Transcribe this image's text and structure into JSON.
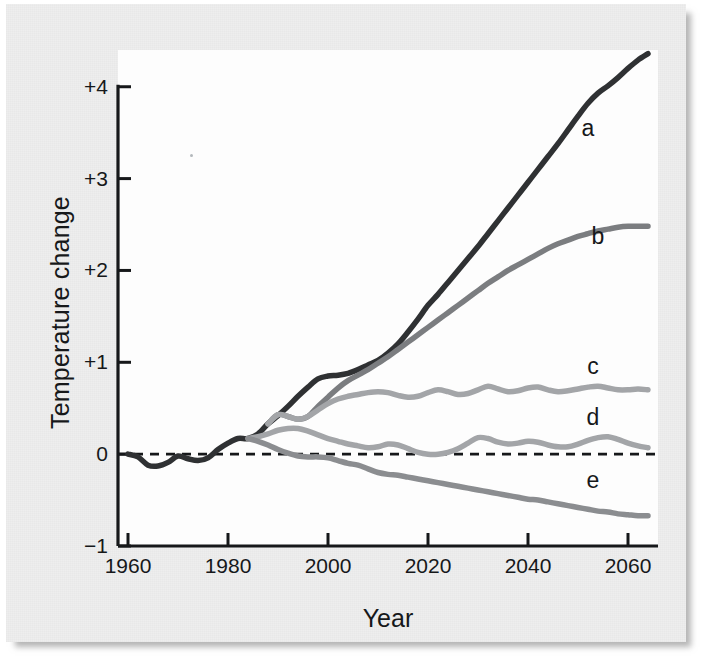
{
  "figure": {
    "background_color": "#eeeeee",
    "plot_background_color": "#fdfdfd",
    "axis_color": "#16181a",
    "zero_line_label": "0"
  },
  "chart_data": {
    "type": "line",
    "title": "",
    "xlabel": "Year",
    "ylabel": "Temperature change",
    "xlim": [
      1958,
      2066
    ],
    "ylim": [
      -1,
      4.4
    ],
    "xticks": [
      1960,
      1980,
      2000,
      2020,
      2040,
      2060
    ],
    "xtick_labels": [
      "1960",
      "1980",
      "2000",
      "2020",
      "2040",
      "2060"
    ],
    "yticks": [
      -1,
      0,
      1,
      2,
      3,
      4
    ],
    "ytick_labels": [
      "−1",
      "0",
      "+1",
      "+2",
      "+3",
      "+4"
    ],
    "grid": false,
    "legend_position": "inline-right-end-labels",
    "zero_reference_line": {
      "value": 0,
      "style": "dashed",
      "color": "#16181a"
    },
    "annotations": [
      {
        "text": "a",
        "x": 2052,
        "y": 3.55
      },
      {
        "text": "b",
        "x": 2054,
        "y": 2.38
      },
      {
        "text": "c",
        "x": 2053,
        "y": 0.96
      },
      {
        "text": "d",
        "x": 2053,
        "y": 0.4
      },
      {
        "text": "e",
        "x": 2053,
        "y": -0.28
      }
    ],
    "series": [
      {
        "name": "a",
        "label": "a",
        "color": "#2f3133",
        "linewidth": 5.5,
        "x": [
          1960,
          1962,
          1964,
          1966,
          1968,
          1970,
          1972,
          1974,
          1976,
          1978,
          1980,
          1982,
          1984,
          1986,
          1988,
          1990,
          1992,
          1994,
          1996,
          1998,
          2000,
          2002,
          2004,
          2006,
          2008,
          2010,
          2012,
          2014,
          2016,
          2018,
          2020,
          2022,
          2024,
          2026,
          2028,
          2030,
          2032,
          2034,
          2036,
          2038,
          2040,
          2042,
          2044,
          2046,
          2048,
          2050,
          2052,
          2054,
          2056,
          2058,
          2060,
          2062,
          2064
        ],
        "y": [
          0.0,
          -0.03,
          -0.12,
          -0.13,
          -0.09,
          -0.02,
          -0.05,
          -0.07,
          -0.04,
          0.05,
          0.12,
          0.17,
          0.17,
          0.22,
          0.33,
          0.42,
          0.52,
          0.63,
          0.73,
          0.82,
          0.85,
          0.86,
          0.88,
          0.92,
          0.97,
          1.02,
          1.1,
          1.2,
          1.33,
          1.47,
          1.62,
          1.74,
          1.87,
          2.0,
          2.13,
          2.26,
          2.4,
          2.54,
          2.68,
          2.82,
          2.96,
          3.1,
          3.24,
          3.38,
          3.53,
          3.68,
          3.82,
          3.93,
          4.01,
          4.1,
          4.2,
          4.29,
          4.36
        ]
      },
      {
        "name": "b",
        "label": "b",
        "color": "#7b7d80",
        "linewidth": 5.5,
        "x": [
          1988,
          1990,
          1992,
          1994,
          1996,
          1998,
          2000,
          2002,
          2004,
          2006,
          2008,
          2010,
          2012,
          2014,
          2016,
          2018,
          2020,
          2022,
          2024,
          2026,
          2028,
          2030,
          2032,
          2034,
          2036,
          2038,
          2040,
          2042,
          2044,
          2046,
          2048,
          2050,
          2052,
          2054,
          2056,
          2058,
          2060,
          2062,
          2064
        ],
        "y": [
          0.33,
          0.43,
          0.41,
          0.38,
          0.41,
          0.52,
          0.62,
          0.72,
          0.8,
          0.86,
          0.92,
          0.99,
          1.06,
          1.14,
          1.22,
          1.3,
          1.38,
          1.46,
          1.54,
          1.62,
          1.7,
          1.78,
          1.86,
          1.93,
          2.0,
          2.06,
          2.12,
          2.18,
          2.24,
          2.29,
          2.33,
          2.37,
          2.4,
          2.43,
          2.45,
          2.47,
          2.48,
          2.48,
          2.48
        ]
      },
      {
        "name": "c",
        "label": "c",
        "color": "#a3a5a8",
        "linewidth": 5.5,
        "x": [
          1988,
          1990,
          1992,
          1994,
          1996,
          1998,
          2000,
          2002,
          2004,
          2006,
          2008,
          2010,
          2012,
          2014,
          2016,
          2018,
          2020,
          2022,
          2024,
          2026,
          2028,
          2030,
          2032,
          2034,
          2036,
          2038,
          2040,
          2042,
          2044,
          2046,
          2048,
          2050,
          2052,
          2054,
          2056,
          2058,
          2060,
          2062,
          2064
        ],
        "y": [
          0.33,
          0.43,
          0.41,
          0.38,
          0.41,
          0.48,
          0.55,
          0.6,
          0.63,
          0.65,
          0.67,
          0.68,
          0.67,
          0.64,
          0.62,
          0.63,
          0.67,
          0.7,
          0.68,
          0.65,
          0.66,
          0.7,
          0.74,
          0.71,
          0.68,
          0.69,
          0.72,
          0.73,
          0.7,
          0.68,
          0.69,
          0.71,
          0.73,
          0.74,
          0.72,
          0.7,
          0.7,
          0.71,
          0.7
        ]
      },
      {
        "name": "d",
        "label": "d",
        "color": "#a3a5a8",
        "linewidth": 5.5,
        "x": [
          1984,
          1986,
          1988,
          1990,
          1992,
          1994,
          1996,
          1998,
          2000,
          2002,
          2004,
          2006,
          2008,
          2010,
          2012,
          2014,
          2016,
          2018,
          2020,
          2022,
          2024,
          2026,
          2028,
          2030,
          2032,
          2034,
          2036,
          2038,
          2040,
          2042,
          2044,
          2046,
          2048,
          2050,
          2052,
          2054,
          2056,
          2058,
          2060,
          2062,
          2064
        ],
        "y": [
          0.17,
          0.19,
          0.22,
          0.26,
          0.28,
          0.28,
          0.25,
          0.21,
          0.17,
          0.14,
          0.11,
          0.09,
          0.07,
          0.08,
          0.11,
          0.1,
          0.06,
          0.02,
          0.0,
          0.0,
          0.02,
          0.06,
          0.12,
          0.18,
          0.17,
          0.13,
          0.11,
          0.12,
          0.14,
          0.13,
          0.1,
          0.08,
          0.08,
          0.11,
          0.15,
          0.18,
          0.19,
          0.16,
          0.12,
          0.09,
          0.07
        ]
      },
      {
        "name": "e",
        "label": "e",
        "color": "#8b8d90",
        "linewidth": 5.5,
        "x": [
          1984,
          1986,
          1988,
          1990,
          1992,
          1994,
          1996,
          1998,
          2000,
          2002,
          2004,
          2006,
          2008,
          2010,
          2012,
          2014,
          2016,
          2018,
          2020,
          2022,
          2024,
          2026,
          2028,
          2030,
          2032,
          2034,
          2036,
          2038,
          2040,
          2042,
          2044,
          2046,
          2048,
          2050,
          2052,
          2054,
          2056,
          2058,
          2060,
          2062,
          2064
        ],
        "y": [
          0.17,
          0.14,
          0.1,
          0.05,
          0.01,
          -0.02,
          -0.03,
          -0.03,
          -0.04,
          -0.07,
          -0.1,
          -0.12,
          -0.16,
          -0.2,
          -0.22,
          -0.23,
          -0.25,
          -0.27,
          -0.29,
          -0.31,
          -0.33,
          -0.35,
          -0.37,
          -0.39,
          -0.41,
          -0.43,
          -0.45,
          -0.47,
          -0.49,
          -0.5,
          -0.52,
          -0.54,
          -0.56,
          -0.58,
          -0.6,
          -0.62,
          -0.63,
          -0.65,
          -0.66,
          -0.67,
          -0.67
        ]
      }
    ]
  }
}
